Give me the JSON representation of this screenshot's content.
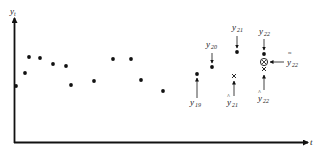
{
  "figure": {
    "axis_y_label": "y_t",
    "axis_x_label": "t",
    "colors": {
      "ink": "#111111",
      "label": "#222222",
      "background": "#ffffff"
    }
  },
  "points": [
    {
      "x": 16,
      "y": 86
    },
    {
      "x": 25,
      "y": 73
    },
    {
      "x": 29,
      "y": 57
    },
    {
      "x": 40,
      "y": 58
    },
    {
      "x": 53,
      "y": 64
    },
    {
      "x": 66,
      "y": 66
    },
    {
      "x": 71,
      "y": 85
    },
    {
      "x": 94,
      "y": 81
    },
    {
      "x": 113,
      "y": 59
    },
    {
      "x": 131,
      "y": 59
    },
    {
      "x": 141,
      "y": 80
    },
    {
      "x": 163,
      "y": 91
    },
    {
      "x": 197,
      "y": 74
    },
    {
      "x": 212,
      "y": 67
    },
    {
      "x": 237,
      "y": 52
    },
    {
      "x": 264,
      "y": 54
    }
  ],
  "annotations": {
    "y19": {
      "main": "y",
      "sub": "19"
    },
    "y20": {
      "main": "y",
      "sub": "20"
    },
    "y21": {
      "main": "y",
      "sub": "21"
    },
    "y22": {
      "main": "y",
      "sub": "22"
    },
    "yhat21": {
      "main": "y",
      "sub": "21",
      "accent": "^"
    },
    "yhat22": {
      "main": "y",
      "sub": "22",
      "accent": "^"
    },
    "ytilde22": {
      "main": "y",
      "sub": "22",
      "accent": "≈"
    }
  },
  "forecast_markers": [
    {
      "type": "cross",
      "x": 234,
      "y": 76,
      "label": "ŷ21"
    },
    {
      "type": "cross",
      "x": 264,
      "y": 69,
      "label": "ŷ22"
    },
    {
      "type": "circled-cross",
      "x": 264,
      "y": 62,
      "label": "ỹ22"
    }
  ]
}
